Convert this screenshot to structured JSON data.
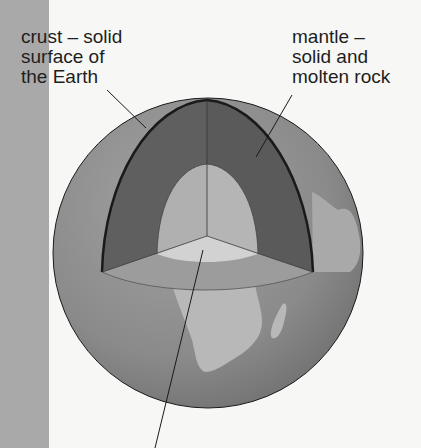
{
  "diagram": {
    "labels": {
      "crust": "crust – solid\nsurface of\nthe Earth",
      "mantle": "mantle –\nsolid and\nmolten rock"
    },
    "colors": {
      "background": "#f7f7f5",
      "side_strip": "#a9a9a9",
      "globe_surface": "#8a8a8a",
      "continents": "#b5b5b5",
      "mantle": "#5f5f5f",
      "core": "#b3b3b3",
      "core_cut": "#cfcfcf",
      "crust_cut": "#9a9a9a",
      "lines": "#1a1a1a"
    }
  }
}
